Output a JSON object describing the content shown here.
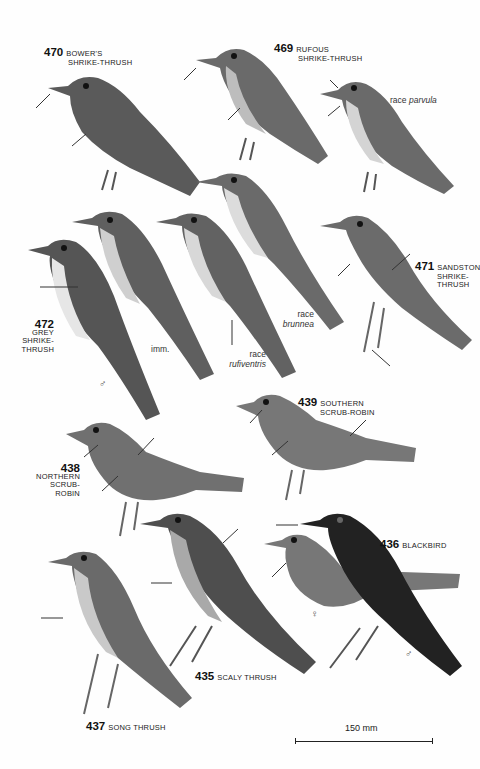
{
  "plate": {
    "species": [
      {
        "number": "470",
        "name_line1": "BOWER'S",
        "name_line2": "SHRIKE-THRUSH"
      },
      {
        "number": "469",
        "name_line1": "RUFOUS",
        "name_line2": "SHRIKE-THRUSH"
      },
      {
        "number": "472",
        "name_line1": "GREY",
        "name_line2": "SHRIKE-",
        "name_line3": "THRUSH"
      },
      {
        "number": "471",
        "name_line1": "SANDSTON",
        "name_line2": "SHRIKE-",
        "name_line3": "THRUSH"
      },
      {
        "number": "439",
        "name_line1": "SOUTHERN",
        "name_line2": "SCRUB-ROBIN"
      },
      {
        "number": "438",
        "name_line1": "NORTHERN",
        "name_line2": "SCRUB-",
        "name_line3": "ROBIN"
      },
      {
        "number": "436",
        "name_line1": "BLACKBIRD"
      },
      {
        "number": "435",
        "name_line1": "SCALY THRUSH"
      },
      {
        "number": "437",
        "name_line1": "SONG THRUSH"
      }
    ],
    "notes": {
      "parvula_prefix": "race",
      "parvula": "parvula",
      "brunnea_prefix": "race",
      "brunnea": "brunnea",
      "rufiventris_prefix": "race",
      "rufiventris": "rufiventris",
      "imm": "imm.",
      "male": "♂",
      "female": "♀"
    },
    "scale_bar": "150 mm",
    "colors": {
      "ink": "#1a1a1a",
      "paper": "#fefefe"
    }
  }
}
